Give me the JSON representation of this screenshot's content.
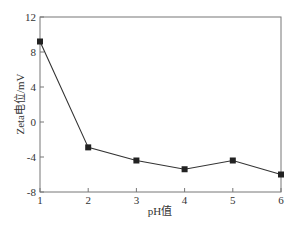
{
  "chart_data": {
    "type": "line",
    "title": "",
    "xlabel": "pH值",
    "ylabel": "Zeta电位/mV",
    "x": [
      1,
      2,
      3,
      4,
      5,
      6
    ],
    "series": [
      {
        "name": "Zeta电位",
        "values": [
          9.2,
          -2.9,
          -4.4,
          -5.4,
          -4.4,
          -6.0
        ],
        "marker": "square",
        "color": "#222222"
      }
    ],
    "xlim": [
      1,
      6
    ],
    "ylim": [
      -8,
      12
    ],
    "xticks": [
      1,
      2,
      3,
      4,
      5,
      6
    ],
    "yticks": [
      -8,
      -4,
      0,
      4,
      8,
      12
    ],
    "grid": false,
    "legend": null
  },
  "colors": {
    "axis": "#666666",
    "line": "#333333",
    "marker": "#111111"
  }
}
